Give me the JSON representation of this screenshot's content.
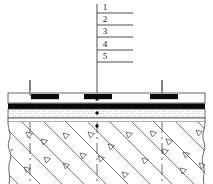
{
  "diagram": {
    "callouts": [
      {
        "id": "1",
        "label": "1",
        "x": 100,
        "y": 4,
        "tick_y": 13,
        "tick_x1": 97,
        "tick_x2": 133
      },
      {
        "id": "2",
        "label": "2",
        "x": 100,
        "y": 16,
        "tick_y": 25,
        "tick_x1": 97,
        "tick_x2": 133
      },
      {
        "id": "3",
        "label": "3",
        "x": 100,
        "y": 28,
        "tick_y": 37,
        "tick_x1": 97,
        "tick_x2": 133
      },
      {
        "id": "4",
        "label": "4",
        "x": 100,
        "y": 41,
        "tick_y": 50,
        "tick_x1": 97,
        "tick_x2": 133
      },
      {
        "id": "5",
        "label": "5",
        "x": 100,
        "y": 53,
        "tick_y": 62,
        "tick_x1": 97,
        "tick_x2": 133
      }
    ],
    "leader": {
      "x": 97,
      "y_top": 4,
      "y_bottom": 115
    },
    "layers": [
      {
        "name": "surface-course",
        "y": 93,
        "height": 10,
        "fill": "#ffffff",
        "stroke": "#555555"
      },
      {
        "name": "binder-black-course",
        "y": 103,
        "height": 6,
        "fill": "#0a0a0a",
        "stroke": "#0a0a0a"
      },
      {
        "name": "granular-base-stippled",
        "y": 109,
        "height": 9,
        "fill": "#f2f2f2",
        "stroke": "#555555"
      },
      {
        "name": "subbase-thin",
        "y": 118,
        "height": 4,
        "fill": "#ffffff",
        "stroke": "#555555"
      },
      {
        "name": "subgrade-soil-hatched",
        "y": 122,
        "height": 62,
        "fill": "#ffffff",
        "stroke": "#555555"
      }
    ],
    "blocks": [
      {
        "name": "embedded-block-left",
        "x": 31,
        "y": 94,
        "width": 28,
        "height": 5
      },
      {
        "name": "embedded-block-center",
        "x": 84,
        "y": 94,
        "width": 28,
        "height": 5
      },
      {
        "name": "embedded-block-right",
        "x": 150,
        "y": 94,
        "width": 28,
        "height": 5
      }
    ],
    "dashed_verticals": [
      {
        "name": "dash-line-left",
        "x": 30,
        "y_top": 80,
        "y_bottom": 184
      },
      {
        "name": "dash-line-center",
        "x": 97,
        "y_top": 80,
        "y_bottom": 184
      },
      {
        "name": "dash-line-right",
        "x": 162,
        "y_top": 80,
        "y_bottom": 184
      }
    ],
    "pointer_dots": [
      {
        "name": "dot-surface",
        "x": 97,
        "y": 99
      },
      {
        "name": "dot-granular",
        "x": 97,
        "y": 113
      },
      {
        "name": "dot-subgrade",
        "x": 97,
        "y": 126
      }
    ],
    "soil_triangles": [
      {
        "x": 26,
        "y": 132
      },
      {
        "x": 41,
        "y": 139
      },
      {
        "x": 63,
        "y": 133
      },
      {
        "x": 88,
        "y": 132
      },
      {
        "x": 108,
        "y": 144
      },
      {
        "x": 126,
        "y": 132
      },
      {
        "x": 150,
        "y": 131
      },
      {
        "x": 166,
        "y": 139
      },
      {
        "x": 196,
        "y": 130
      },
      {
        "x": 44,
        "y": 157
      },
      {
        "x": 63,
        "y": 163
      },
      {
        "x": 80,
        "y": 153
      },
      {
        "x": 98,
        "y": 156
      },
      {
        "x": 142,
        "y": 158
      },
      {
        "x": 162,
        "y": 149
      },
      {
        "x": 183,
        "y": 152
      },
      {
        "x": 199,
        "y": 163
      },
      {
        "x": 24,
        "y": 167
      },
      {
        "x": 122,
        "y": 172
      },
      {
        "x": 180,
        "y": 168
      }
    ],
    "colors": {
      "ink": "#1a1a1a",
      "line": "#555555",
      "black_layer": "#0a0a0a",
      "stipple": "#f2f2f2",
      "background": "#ffffff"
    }
  }
}
